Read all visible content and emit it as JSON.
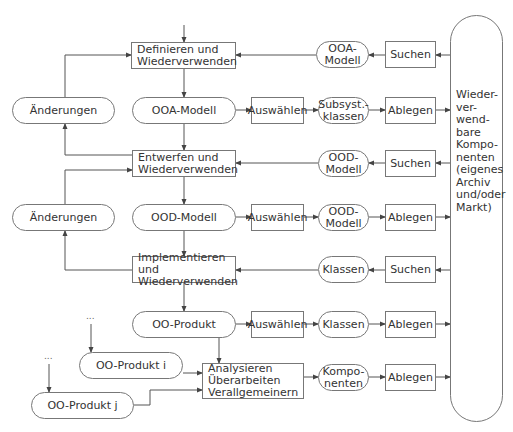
{
  "diagram": {
    "title": "",
    "nodes": {
      "definieren": "Definieren und\nWiederverwenden",
      "entwerfen": "Entwerfen und\nWiederverwenden",
      "implementieren": "Implementieren und\nWiederverwenden",
      "analysieren": "Analysieren\nÜberarbeiten\nVerallgemeinern",
      "aenderungen_1": "Änderungen",
      "aenderungen_2": "Änderungen",
      "ooa_modell_main": "OOA-Modell",
      "ood_modell_main": "OOD-Modell",
      "oo_produkt": "OO-Produkt",
      "oo_produkt_i": "OO-Produkt i",
      "oo_produkt_j": "OO-Produkt j",
      "ellipsis_i": "...",
      "ellipsis_j": "...",
      "auswaehlen_1": "Auswählen",
      "auswaehlen_2": "Auswählen",
      "auswaehlen_3": "Auswählen",
      "subsyst_klassen": "Subsyst.-\nklassen",
      "ood_modell_out": "OOD-\nModell",
      "klassen_out": "Klassen",
      "komponenten_out": "Kompo-\nnenten",
      "ablegen_1": "Ablegen",
      "ablegen_2": "Ablegen",
      "ablegen_3": "Ablegen",
      "ablegen_4": "Ablegen",
      "suchen_1": "Suchen",
      "suchen_2": "Suchen",
      "suchen_3": "Suchen",
      "ooa_modell_in": "OOA-\nModell",
      "ood_modell_in": "OOD-\nModell",
      "klassen_in": "Klassen",
      "repository": "Wieder-\nver-\nwend-\nbare\nKompo-\nnenten\n(eigenes\nArchiv\nund/oder\nMarkt)"
    },
    "colors": {
      "line": "#555555",
      "border": "#777777",
      "text": "#333333",
      "background": "#ffffff"
    }
  }
}
